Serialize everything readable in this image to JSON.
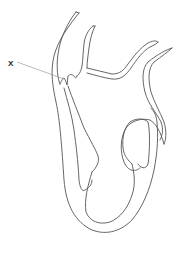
{
  "diagram": {
    "labels": [
      {
        "id": "x",
        "text": "X",
        "points_to": "valve"
      }
    ],
    "colors": {
      "stroke": "#555555",
      "leader": "#8a8a8a",
      "label": "#222222",
      "background": "#ffffff"
    }
  }
}
